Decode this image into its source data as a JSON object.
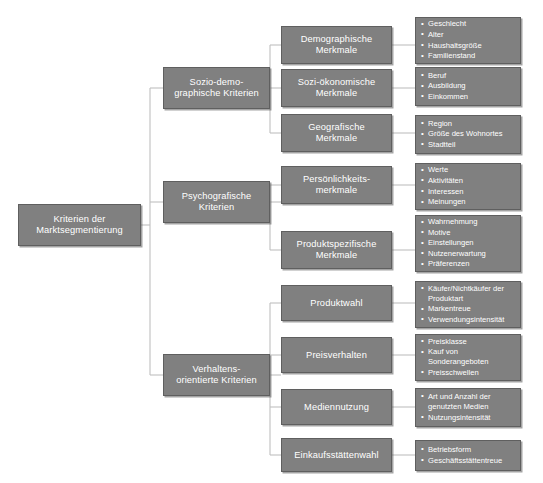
{
  "diagram": {
    "title": "Kriterien der Marktsegmentierung",
    "type": "tree",
    "colors": {
      "node_fill": "#808080",
      "node_border": "#5f5f5f",
      "node_text": "#ffffff",
      "connector": "#bfbfbf",
      "background": "#ffffff"
    },
    "root": {
      "label": "Kriterien der\nMarktsegmentierung"
    },
    "branches": [
      {
        "label": "Sozio-demo-\ngraphische Kriterien",
        "children": [
          {
            "label": "Demographische\nMerkmale",
            "items": [
              "Geschlecht",
              "Alter",
              "Haushaltsgröße",
              "Familienstand"
            ]
          },
          {
            "label": "Sozi-ökonomische\nMerkmale",
            "items": [
              "Beruf",
              "Ausbildung",
              "Einkommen"
            ]
          },
          {
            "label": "Geografische\nMerkmale",
            "items": [
              "Region",
              "Größe des Wohnortes",
              "Stadtteil"
            ]
          }
        ]
      },
      {
        "label": "Psychografische\nKriterien",
        "children": [
          {
            "label": "Persönlichkeits-\nmerkmale",
            "items": [
              "Werte",
              "Aktivitäten",
              "Interessen",
              "Meinungen"
            ]
          },
          {
            "label": "Produktspezifische\nMerkmale",
            "items": [
              "Wahrnehmung",
              "Motive",
              "Einstellungen",
              "Nutzenerwartung",
              "Präferenzen"
            ]
          }
        ]
      },
      {
        "label": "Verhaltens-\norientierte Kriterien",
        "children": [
          {
            "label": "Produktwahl",
            "items": [
              "Käufer/Nichtkäufer der Produktart",
              "Markentreue",
              "Verwendungsintensität"
            ]
          },
          {
            "label": "Preisverhalten",
            "items": [
              "Preisklasse",
              "Kauf von Sonderangeboten",
              "Preisschwellen"
            ]
          },
          {
            "label": "Mediennutzung",
            "items": [
              "Art und Anzahl der genutzten Medien",
              "Nutzungsintensität"
            ]
          },
          {
            "label": "Einkaufsstättenwahl",
            "items": [
              "Betriebsform",
              "Geschäftsstättentreue"
            ]
          }
        ]
      }
    ]
  }
}
